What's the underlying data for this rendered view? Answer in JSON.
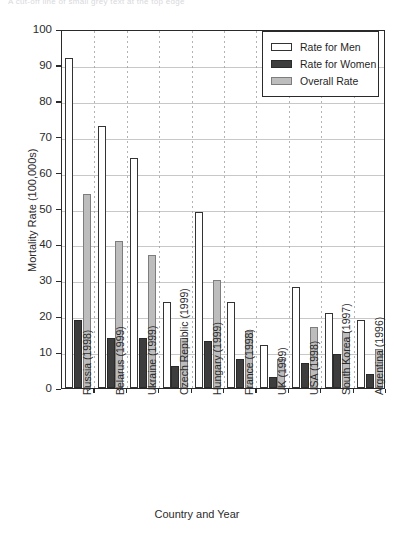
{
  "clipped_header_text": "A cut-off line of small grey text at the top edge",
  "chart_data": {
    "type": "bar",
    "title": "",
    "xlabel": "Country and Year",
    "ylabel": "Mortality Rate (100,000s)",
    "ylim": [
      0,
      100
    ],
    "ytick_step": 10,
    "yticks": [
      "0",
      "10",
      "20",
      "30",
      "40",
      "50",
      "60",
      "70",
      "80",
      "90",
      "100"
    ],
    "grid": "horizontal-and-vertical-dotted",
    "legend_position": "top-right-inside",
    "categories": [
      "Russia (1998)",
      "Belarus (1999)",
      "Ukraine (1999)",
      "Czech Republic (1999)",
      "Hungary (1999)",
      "France (1998)",
      "UK (1999)",
      "USA (1998)",
      "South Korea (1997)",
      "Argentina (1996)"
    ],
    "series": [
      {
        "name": "Rate for Men",
        "color": "#ffffff",
        "values": [
          92,
          73,
          64,
          24,
          49,
          24,
          12,
          28,
          21,
          19
        ]
      },
      {
        "name": "Rate for Women",
        "color": "#3d3d3d",
        "values": [
          19,
          14,
          14,
          6,
          13,
          8,
          3,
          7,
          9.5,
          4
        ]
      },
      {
        "name": "Overall Rate",
        "color": "#bdbdbd",
        "values": [
          54,
          41,
          37,
          14,
          30,
          16,
          8,
          17,
          15.5,
          11
        ]
      }
    ]
  },
  "legend": {
    "items": [
      {
        "label": "Rate for Men",
        "swatch": "men"
      },
      {
        "label": "Rate for Women",
        "swatch": "women"
      },
      {
        "label": "Overall Rate",
        "swatch": "overall"
      }
    ]
  },
  "colors": {
    "men": "#ffffff",
    "women": "#3d3d3d",
    "overall": "#bdbdbd",
    "axis": "#2a2a2a",
    "grid": "#9a9a9a",
    "background": "#ffffff"
  }
}
